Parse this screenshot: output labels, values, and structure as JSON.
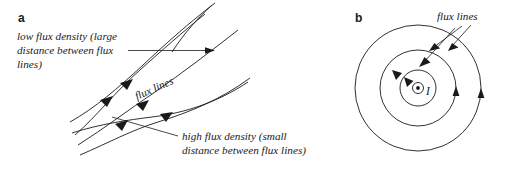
{
  "figure": {
    "background_color": "#ffffff",
    "ink_color": "#1a1a1a"
  },
  "panel_a": {
    "letter": "a",
    "low_density_label": {
      "line1": "low flux density (large",
      "line2": "distance between flux",
      "line3": "lines)"
    },
    "flux_lines_label": "flux lines",
    "high_density_label": {
      "line1": "high flux density (small",
      "line2": "distance between flux lines)"
    }
  },
  "panel_b": {
    "letter": "b",
    "flux_lines_label": "flux lines",
    "current_label": "I",
    "current_symbol": "current-out-of-page-dot",
    "circle_count": 3
  }
}
